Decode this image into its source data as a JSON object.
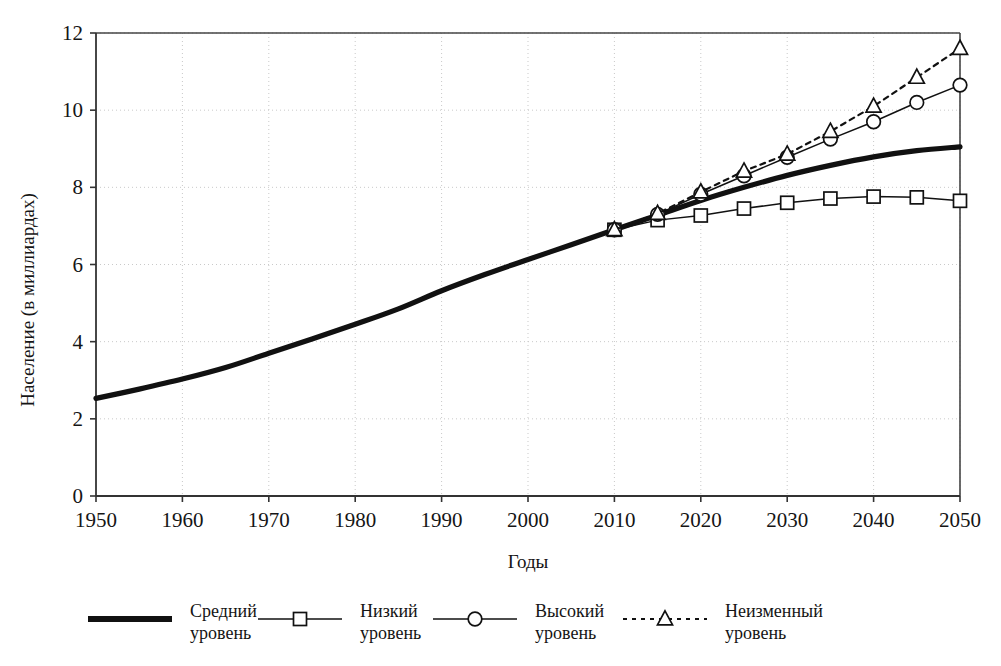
{
  "chart_data": {
    "type": "line",
    "title": "",
    "xlabel": "Годы",
    "ylabel": "Население (в миллиардах)",
    "xlim": [
      1950,
      2050
    ],
    "ylim": [
      0,
      12
    ],
    "ytick_values": [
      0,
      2,
      4,
      6,
      8,
      10,
      12
    ],
    "ytick_labels": [
      "0",
      "2",
      "4",
      "6",
      "8",
      "10",
      "12"
    ],
    "xtick_values": [
      1950,
      1960,
      1970,
      1980,
      1990,
      2000,
      2010,
      2020,
      2030,
      2040,
      2050
    ],
    "xtick_labels": [
      "1950",
      "1960",
      "1970",
      "1980",
      "1990",
      "2000",
      "2010",
      "2020",
      "2030",
      "2040",
      "2050"
    ],
    "grid": true,
    "grid_style": "dotted",
    "legend_position": "bottom",
    "branch_year": 2010,
    "branch_value": 6.9,
    "series": [
      {
        "name": "Средний уровень",
        "legend_label_line1": "Средний",
        "legend_label_line2": "уровень",
        "marker": "none",
        "line_style": "solid-thick",
        "color": "#111111",
        "x": [
          1950,
          1955,
          1960,
          1965,
          1970,
          1975,
          1980,
          1985,
          1990,
          1995,
          2000,
          2005,
          2010,
          2015,
          2020,
          2025,
          2030,
          2035,
          2040,
          2045,
          2050
        ],
        "values": [
          2.53,
          2.77,
          3.03,
          3.33,
          3.7,
          4.07,
          4.45,
          4.85,
          5.32,
          5.74,
          6.13,
          6.51,
          6.9,
          7.28,
          7.66,
          8.0,
          8.31,
          8.57,
          8.79,
          8.95,
          9.05
        ]
      },
      {
        "name": "Низкий уровень",
        "legend_label_line1": "Низкий",
        "legend_label_line2": "уровень",
        "marker": "square",
        "line_style": "solid-thin",
        "color": "#111111",
        "x": [
          2010,
          2015,
          2020,
          2025,
          2030,
          2035,
          2040,
          2045,
          2050
        ],
        "values": [
          6.9,
          7.15,
          7.27,
          7.45,
          7.6,
          7.71,
          7.76,
          7.74,
          7.65
        ]
      },
      {
        "name": "Высокий уровень",
        "legend_label_line1": "Высокий",
        "legend_label_line2": "уровень",
        "marker": "circle",
        "line_style": "solid-thin",
        "color": "#111111",
        "x": [
          2010,
          2015,
          2020,
          2025,
          2030,
          2035,
          2040,
          2045,
          2050
        ],
        "values": [
          6.9,
          7.3,
          7.82,
          8.3,
          8.78,
          9.25,
          9.7,
          10.2,
          10.65
        ]
      },
      {
        "name": "Неизменный уровень",
        "legend_label_line1": "Неизменный",
        "legend_label_line2": "уровень",
        "marker": "triangle",
        "line_style": "dashed",
        "color": "#111111",
        "x": [
          2010,
          2015,
          2020,
          2025,
          2030,
          2035,
          2040,
          2045,
          2050
        ],
        "values": [
          6.9,
          7.32,
          7.88,
          8.42,
          8.86,
          9.45,
          10.1,
          10.85,
          11.6
        ]
      }
    ]
  },
  "axes": {
    "x_title": "Годы",
    "y_title": "Население (в миллиардах)"
  },
  "colors": {
    "line": "#111111",
    "frame": "#444444",
    "grid": "#c9c9c9",
    "background": "#ffffff"
  }
}
